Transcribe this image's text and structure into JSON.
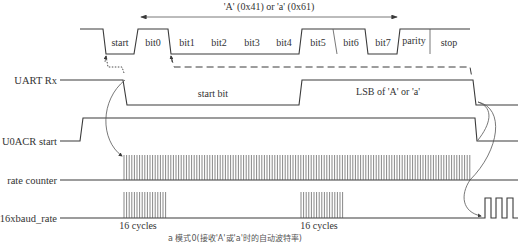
{
  "title": "'A' (0x41) or 'a' (0x61)",
  "frame_bits": [
    "start",
    "bit0",
    "bit1",
    "bit2",
    "bit3",
    "bit4",
    "bit5",
    "bit6",
    "bit7",
    "parity",
    "stop"
  ],
  "signals": {
    "uart_rx": "UART Rx",
    "u0acr_start": "U0ACR start",
    "rate_counter": "rate counter",
    "baud16": "16xbaud_rate"
  },
  "annotations": {
    "start_bit": "start bit",
    "lsb": "LSB of 'A' or 'a'",
    "cycles_1": "16 cycles",
    "cycles_2": "16 cycles"
  },
  "caption": "a 模式0(接收'A'或'a'时的自动波特率)",
  "colors": {
    "line": "#3a3a3a",
    "text": "#333333",
    "background": "#ffffff"
  }
}
